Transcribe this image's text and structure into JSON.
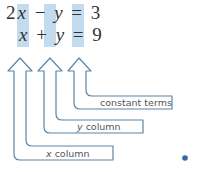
{
  "equations": [
    {
      "coef": "2",
      "x": "x",
      "op": "−",
      "y": "y",
      "eq": "=",
      "const": "3"
    },
    {
      "coef": "",
      "x": "x",
      "op": "+",
      "y": "y",
      "eq": "=",
      "const": "9"
    }
  ],
  "labels": {
    "constant": "constant terms",
    "y_var": "y",
    "y_rest": " column",
    "x_var": "x",
    "x_rest": " column"
  },
  "colors": {
    "highlight": "#c2dbee",
    "arrow_stroke": "#5b86a6",
    "dot": "#2e6a9e"
  }
}
